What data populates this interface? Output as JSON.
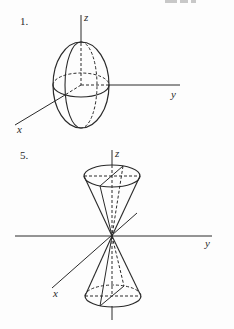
{
  "top_fragment": "partial cut-off text",
  "figures": [
    {
      "number": "1.",
      "shape": "ellipsoid",
      "axes": {
        "z": "z",
        "y": "y",
        "x": "x"
      }
    },
    {
      "number": "5.",
      "shape": "double cone",
      "axes": {
        "z": "z",
        "y": "y",
        "x": "x"
      }
    }
  ],
  "colors": {
    "ink": "#2a2a2a",
    "background": "#fdfdfd"
  }
}
